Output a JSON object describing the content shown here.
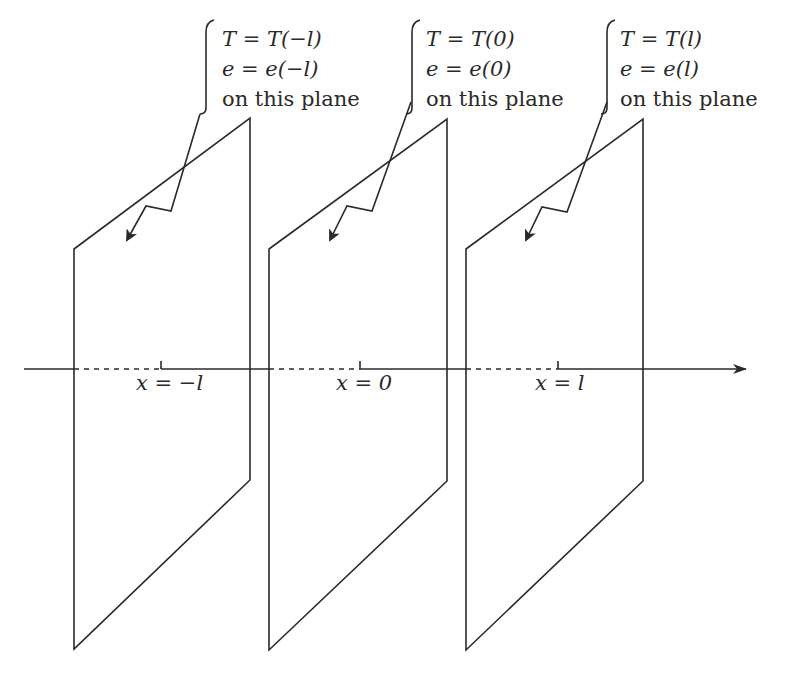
{
  "diagram": {
    "type": "three parallel planes perpendicular to x-axis",
    "axis": {
      "direction": "right-arrow"
    },
    "planes": [
      {
        "position_label": "x = −l",
        "annotation": [
          "T = T(−l)",
          "e = e(−l)",
          "on this plane"
        ]
      },
      {
        "position_label": "x = 0",
        "annotation": [
          "T = T(0)",
          "e = e(0)",
          "on this plane"
        ]
      },
      {
        "position_label": "x = l",
        "annotation": [
          "T = T(l)",
          "e = e(l)",
          "on this plane"
        ]
      }
    ],
    "colors": {
      "ink": "#2a2a2a",
      "background": "#ffffff"
    }
  }
}
